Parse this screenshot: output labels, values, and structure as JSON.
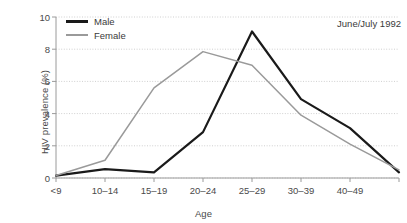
{
  "chart_data": {
    "type": "line",
    "title": "",
    "annotation": "June/July 1992",
    "xlabel": "Age",
    "ylabel": "HIV prevalence (%)",
    "categories": [
      "<9",
      "10–14",
      "15–19",
      "20–24",
      "25–29",
      "30–39",
      "40–49",
      ""
    ],
    "x_tick_labels": [
      "<9",
      "10–14",
      "15–19",
      "20–24",
      "25–29",
      "30–39",
      "40–49"
    ],
    "y_tick_labels": [
      "0",
      "2",
      "4",
      "6",
      "8",
      "10"
    ],
    "y_ticks": [
      0,
      2,
      4,
      6,
      8,
      10
    ],
    "ylim": [
      0,
      10
    ],
    "grid": true,
    "legend_position": "top-left",
    "series": [
      {
        "name": "Male",
        "color": "#1a1a1a",
        "values": [
          0.15,
          0.55,
          0.35,
          2.85,
          9.1,
          4.9,
          3.1,
          0.35
        ]
      },
      {
        "name": "Female",
        "color": "#9a9a9a",
        "values": [
          0.15,
          1.1,
          5.6,
          7.85,
          7.0,
          3.9,
          2.1,
          0.5
        ]
      }
    ]
  },
  "colors": {
    "male": "#1a1a1a",
    "female": "#9a9a9a",
    "grid": "#cfcfcf",
    "axis": "#9a9a9a",
    "text": "#3a3a3a"
  }
}
